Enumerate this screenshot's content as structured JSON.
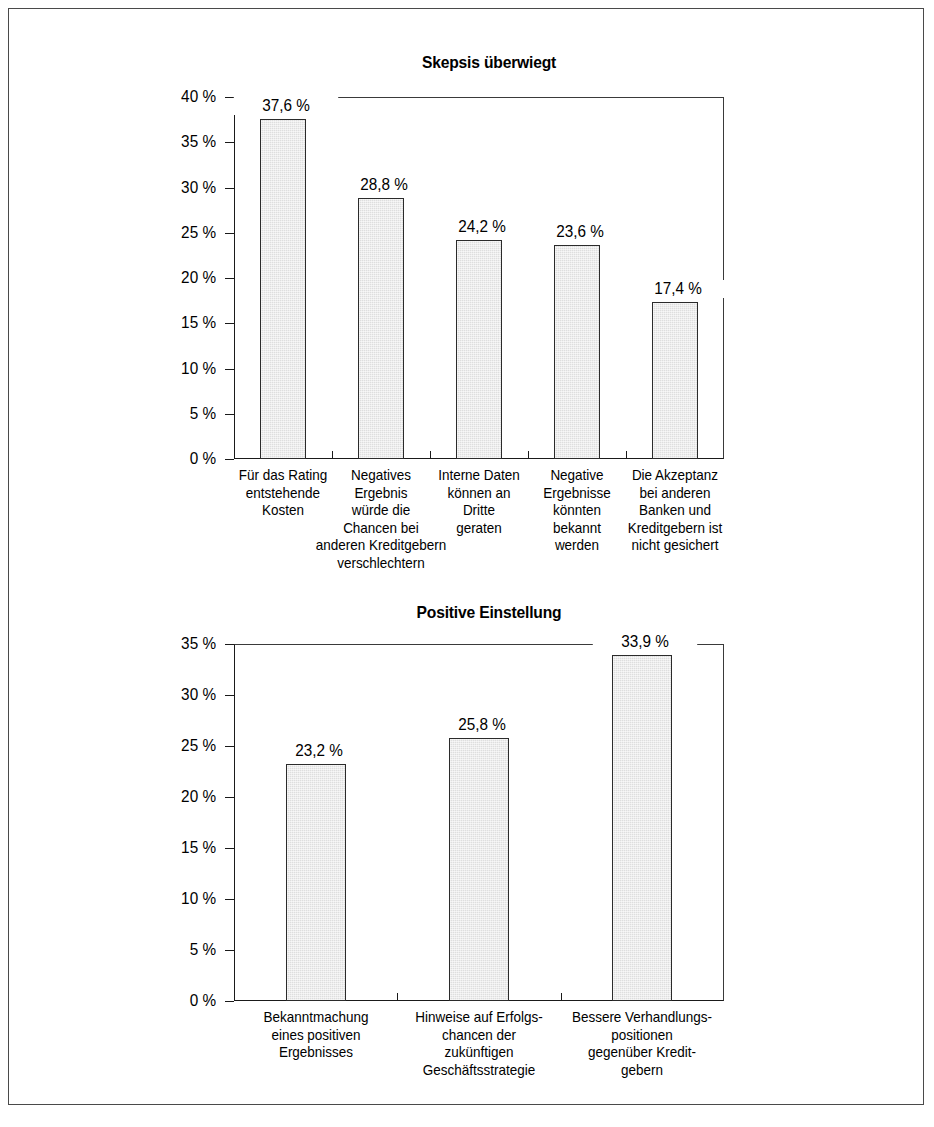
{
  "page": {
    "background_color": "#ffffff",
    "frame_color": "#4a4a4a"
  },
  "charts": [
    {
      "title": "Skepsis überwiegt",
      "axis_labels": [
        "40 %",
        "35 %",
        "30 %",
        "25 %",
        "20 %",
        "15 %",
        "10 %",
        "5 %",
        "0 %"
      ],
      "value_labels": [
        "37,6 %",
        "28,8 %",
        "24,2 %",
        "23,6 %",
        "17,4 %"
      ],
      "categories": [
        "Für das Rating\nentstehende\nKosten",
        "Negatives\nErgebnis\nwürde die\nChancen bei\nanderen Kreditgebern\nverschlechtern",
        "Interne Daten\nkönnen an\nDritte\ngeraten",
        "Negative\nErgebnisse\nkönnten\nbekannt\nwerden",
        "Die Akzeptanz\nbei anderen\nBanken und\nKreditgebern ist\nnicht gesichert"
      ]
    },
    {
      "title": "Positive Einstellung",
      "axis_labels": [
        "35 %",
        "30 %",
        "25 %",
        "20 %",
        "15 %",
        "10 %",
        "5 %",
        "0 %"
      ],
      "value_labels": [
        "23,2 %",
        "25,8 %",
        "33,9 %"
      ],
      "categories": [
        "Bekanntmachung\neines positiven\nErgebnisses",
        "Hinweise auf Erfolgs-\nchancen der\nzukünftigen\nGeschäftsstrategie",
        "Bessere Verhandlungs-\npositionen\ngegenüber Kredit-\ngebern"
      ]
    }
  ],
  "chart_data": [
    {
      "type": "bar",
      "title": "Skepsis überwiegt",
      "xlabel": "",
      "ylabel": "",
      "ylim": [
        0,
        40
      ],
      "ytick_step": 5,
      "ytick_labels": [
        "0 %",
        "5 %",
        "10 %",
        "15 %",
        "20 %",
        "25 %",
        "30 %",
        "35 %",
        "40 %"
      ],
      "grid": false,
      "legend": "none",
      "bar_color": "#dedede",
      "bar_edge_color": "#2b2b2b",
      "categories": [
        "Für das Rating entstehende Kosten",
        "Negatives Ergebnis würde die Chancen bei anderen Kreditgebern verschlechtern",
        "Interne Daten können an Dritte geraten",
        "Negative Ergebnisse könnten bekannt werden",
        "Die Akzeptanz bei anderen Banken und Kreditgebern ist nicht gesichert"
      ],
      "values": [
        37.6,
        28.8,
        24.2,
        23.6,
        17.4
      ],
      "data_labels": [
        "37,6 %",
        "28,8 %",
        "24,2 %",
        "23,6 %",
        "17,4 %"
      ]
    },
    {
      "type": "bar",
      "title": "Positive Einstellung",
      "xlabel": "",
      "ylabel": "",
      "ylim": [
        0,
        35
      ],
      "ytick_step": 5,
      "ytick_labels": [
        "0 %",
        "5 %",
        "10 %",
        "15 %",
        "20 %",
        "25 %",
        "30 %",
        "35 %"
      ],
      "grid": false,
      "legend": "none",
      "bar_color": "#dedede",
      "bar_edge_color": "#2b2b2b",
      "categories": [
        "Bekanntmachung eines positiven Ergebnisses",
        "Hinweise auf Erfolgschancen der zukünftigen Geschäftsstrategie",
        "Bessere Verhandlungspositionen gegenüber Kreditgebern"
      ],
      "values": [
        23.2,
        25.8,
        33.9
      ],
      "data_labels": [
        "23,2 %",
        "25,8 %",
        "33,9 %"
      ]
    }
  ]
}
